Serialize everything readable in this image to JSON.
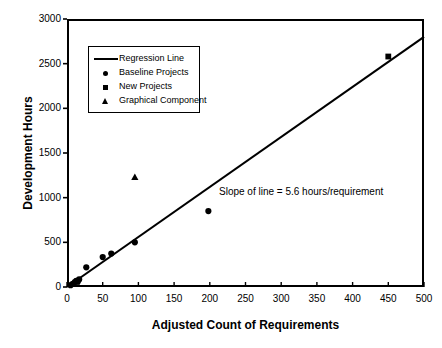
{
  "chart_data": {
    "type": "scatter",
    "title": "",
    "xlabel": "Adjusted Count of Requirements",
    "ylabel": "Development Hours",
    "xlim": [
      0,
      500
    ],
    "ylim": [
      0,
      3000
    ],
    "xticks": [
      0,
      50,
      100,
      150,
      200,
      250,
      300,
      350,
      400,
      450,
      500
    ],
    "yticks": [
      0,
      500,
      1000,
      1500,
      2000,
      2500,
      3000
    ],
    "grid": false,
    "legend_position": "upper-left",
    "annotations": [
      {
        "text": "Slope of line = 5.6 hours/requirement",
        "x": 245,
        "y": 1060
      }
    ],
    "series": [
      {
        "name": "Regression Line",
        "type": "line",
        "marker": "line",
        "slope": 5.6,
        "intercept": 0,
        "points": [
          {
            "x": 0,
            "y": 0
          },
          {
            "x": 500,
            "y": 2800
          }
        ]
      },
      {
        "name": "Baseline Projects",
        "type": "scatter",
        "marker": "circle",
        "points": [
          {
            "x": 5,
            "y": 20
          },
          {
            "x": 8,
            "y": 35
          },
          {
            "x": 11,
            "y": 55
          },
          {
            "x": 13,
            "y": 70
          },
          {
            "x": 15,
            "y": 60
          },
          {
            "x": 17,
            "y": 85
          },
          {
            "x": 27,
            "y": 220
          },
          {
            "x": 50,
            "y": 335
          },
          {
            "x": 62,
            "y": 375
          },
          {
            "x": 95,
            "y": 500
          },
          {
            "x": 198,
            "y": 850
          }
        ]
      },
      {
        "name": "New Projects",
        "type": "scatter",
        "marker": "square",
        "points": [
          {
            "x": 14,
            "y": 60
          },
          {
            "x": 450,
            "y": 2580
          }
        ]
      },
      {
        "name": "Graphical Component",
        "type": "scatter",
        "marker": "triangle",
        "points": [
          {
            "x": 95,
            "y": 1225
          }
        ]
      }
    ]
  },
  "axis": {
    "x_title": "Adjusted Count of Requirements",
    "y_title": "Development Hours",
    "x_tick_labels": [
      "0",
      "50",
      "100",
      "150",
      "200",
      "250",
      "300",
      "350",
      "400",
      "450",
      "500"
    ],
    "y_tick_labels": [
      "0",
      "500",
      "1000",
      "1500",
      "2000",
      "2500",
      "3000"
    ]
  },
  "legend": {
    "items": [
      {
        "label": "Regression Line",
        "marker": "line"
      },
      {
        "label": "Baseline Projects",
        "marker": "circle"
      },
      {
        "label": "New Projects",
        "marker": "square"
      },
      {
        "label": "Graphical Component",
        "marker": "triangle"
      }
    ]
  },
  "annotation": {
    "slope_text": "Slope of line = 5.6 hours/requirement"
  },
  "colors": {
    "ink": "#000000",
    "background": "#ffffff"
  }
}
